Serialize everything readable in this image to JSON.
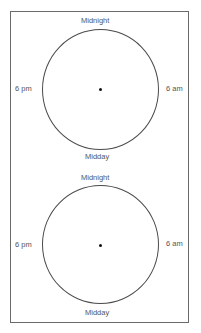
{
  "diagram": {
    "clocks": [
      {
        "top": "Midnight",
        "right": "6 am",
        "bottom": "Midday",
        "left": "6 pm"
      },
      {
        "top": "Midnight",
        "right": "6 am",
        "bottom": "Midday",
        "left": "6 pm"
      }
    ]
  }
}
